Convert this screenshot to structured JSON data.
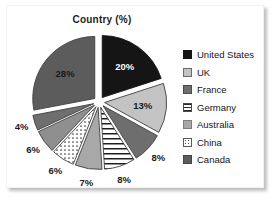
{
  "card": {
    "background_color": "#ffffff"
  },
  "chart_data": {
    "type": "pie",
    "title": "Country (%)",
    "xlabel": "",
    "ylabel": "",
    "grid": false,
    "legend_position": "right",
    "exploded": true,
    "start_angle_deg": 0,
    "direction": "clockwise",
    "categories": [
      "United States",
      "UK",
      "France",
      "Germany",
      "Australia",
      "China",
      "Canada"
    ],
    "values": [
      20,
      13,
      8,
      8,
      7,
      6,
      28
    ],
    "slices": [
      {
        "label": "United States",
        "value": 20,
        "data_label": "20%",
        "color": "#151515",
        "pattern": "solid",
        "label_text_color": "#ffffff"
      },
      {
        "label": "UK",
        "value": 13,
        "data_label": "13%",
        "color": "#c3c3c3",
        "pattern": "solid",
        "label_text_color": "#1a1a1a"
      },
      {
        "label": "France",
        "value": 8,
        "data_label": "8%",
        "color": "#6e6e6e",
        "pattern": "solid",
        "label_text_color": "#1a1a1a"
      },
      {
        "label": "Germany",
        "value": 8,
        "data_label": "8%",
        "color": "#ffffff",
        "pattern": "horizontal-stripes",
        "label_text_color": "#1a1a1a"
      },
      {
        "label": "Australia",
        "value": 7,
        "data_label": "7%",
        "color": "#a8a8a8",
        "pattern": "solid",
        "label_text_color": "#1a1a1a"
      },
      {
        "label": "China",
        "value": 6,
        "data_label": "6%",
        "color": "#ffffff",
        "pattern": "dotted",
        "label_text_color": "#1a1a1a"
      },
      {
        "label": "unlabeled-6",
        "value": 6,
        "data_label": "6%",
        "color": "#8f8f8f",
        "pattern": "solid",
        "label_text_color": "#1a1a1a"
      },
      {
        "label": "unlabeled-4",
        "value": 4,
        "data_label": "4%",
        "color": "#6e6e6e",
        "pattern": "solid",
        "label_text_color": "#1a1a1a"
      },
      {
        "label": "Canada",
        "value": 28,
        "data_label": "28%",
        "color": "#5c5c5c",
        "pattern": "solid",
        "label_text_color": "#1a1a1a"
      }
    ],
    "data_labels": [
      "20%",
      "13%",
      "8%",
      "8%",
      "7%",
      "6%",
      "6%",
      "4%",
      "28%"
    ]
  },
  "legend": {
    "items": [
      {
        "label": "United States",
        "swatch": "#151515",
        "swatch_pattern": "solid"
      },
      {
        "label": "UK",
        "swatch": "#c3c3c3",
        "swatch_pattern": "solid"
      },
      {
        "label": "France",
        "swatch": "#6e6e6e",
        "swatch_pattern": "solid"
      },
      {
        "label": "Germany",
        "swatch": "#ffffff",
        "swatch_pattern": "horizontal-stripes"
      },
      {
        "label": "Australia",
        "swatch": "#a8a8a8",
        "swatch_pattern": "solid"
      },
      {
        "label": "China",
        "swatch": "#ffffff",
        "swatch_pattern": "dotted"
      },
      {
        "label": "Canada",
        "swatch": "#5c5c5c",
        "swatch_pattern": "solid"
      }
    ]
  }
}
